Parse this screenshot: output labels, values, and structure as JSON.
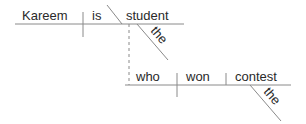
{
  "diagram": {
    "type": "sentence-diagram",
    "main_clause": {
      "subject": "Kareem",
      "verb": "is",
      "predicate_nominative": "student",
      "modifier": "the"
    },
    "relative_clause": {
      "subject": "who",
      "verb": "won",
      "direct_object": "contest",
      "modifier": "the"
    },
    "colors": {
      "line": "#8a8a8a",
      "text": "#2a2a2a"
    }
  }
}
